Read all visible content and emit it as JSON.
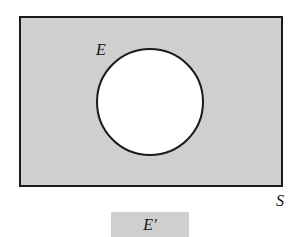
{
  "diagram": {
    "type": "venn",
    "title": "",
    "universe_label": "S",
    "set_label": "E",
    "legend_label": "E′",
    "colors": {
      "shaded": "#cfcfcf",
      "outline": "#1a1a1a",
      "background": "#ffffff",
      "circle_fill": "#ffffff"
    },
    "shaded_region": "complement of E within S"
  }
}
